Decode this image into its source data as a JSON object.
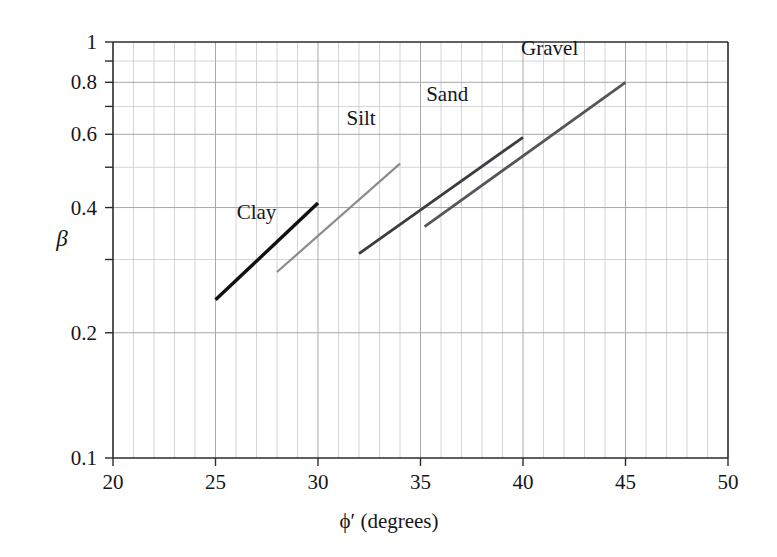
{
  "chart_data": {
    "type": "line",
    "title": "",
    "xlabel": "ϕ′ (degrees)",
    "ylabel": "β",
    "xlim": [
      20,
      50
    ],
    "ylim": [
      0.1,
      1
    ],
    "yscale": "log",
    "xscale": "linear",
    "grid": true,
    "legend": "inline-labels",
    "x_ticks": [
      20,
      25,
      30,
      35,
      40,
      45,
      50
    ],
    "x_tick_labels": [
      "20",
      "25",
      "30",
      "35",
      "40",
      "45",
      "50"
    ],
    "x_minor_step": 1,
    "y_ticks": [
      0.1,
      0.2,
      0.4,
      0.6,
      0.8,
      1
    ],
    "y_tick_labels": [
      "0.1",
      "0.2",
      "0.4",
      "0.6",
      "0.8",
      "1"
    ],
    "y_minor_ticks": [
      0.3,
      0.5,
      0.7,
      0.9
    ],
    "series": [
      {
        "name": "Clay",
        "x": [
          25,
          30
        ],
        "y": [
          0.24,
          0.41
        ],
        "color": "#111114",
        "width": 3.4,
        "label_x": 27.0,
        "label_y": 0.375
      },
      {
        "name": "Silt",
        "x": [
          28,
          34
        ],
        "y": [
          0.28,
          0.51
        ],
        "color": "#8b8b90",
        "width": 2.2,
        "label_x": 32.1,
        "label_y": 0.63
      },
      {
        "name": "Sand",
        "x": [
          32,
          40
        ],
        "y": [
          0.31,
          0.59
        ],
        "color": "#3c3c42",
        "width": 2.8,
        "label_x": 36.3,
        "label_y": 0.72
      },
      {
        "name": "Gravel",
        "x": [
          35.2,
          45
        ],
        "y": [
          0.36,
          0.8
        ],
        "color": "#55555c",
        "width": 2.8,
        "label_x": 41.3,
        "label_y": 0.93
      }
    ]
  },
  "colors": {
    "background": "#ffffff",
    "axis": "#2b2b2e",
    "grid_minor": "#c9c9cc",
    "grid_major": "#a8a8ad",
    "text": "#15161a"
  }
}
